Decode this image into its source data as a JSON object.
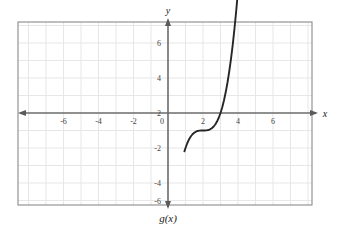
{
  "chart_data": {
    "type": "line",
    "title": "",
    "subtitle": "",
    "function_label": "g(x)",
    "function_expression": "(x - 2)^3 - 1",
    "xlabel": "x",
    "ylabel": "y",
    "xlim": [
      -8.2,
      8.3
    ],
    "ylim": [
      -7.6,
      7.6
    ],
    "grid": true,
    "grid_step": 1,
    "legend_position": "below-axes",
    "x_ticks": [
      -6,
      -4,
      -2,
      0,
      2,
      4,
      6
    ],
    "x_tick_labels": [
      "-6",
      "-4",
      "-2",
      "0",
      "2",
      "4",
      "6"
    ],
    "y_ticks": [
      -6,
      -4,
      -2,
      2,
      4,
      6
    ],
    "y_tick_labels": [
      "-6",
      "-4",
      "-2",
      "2",
      "4",
      "6"
    ],
    "origin_label": "0",
    "key_points": {
      "inflection": [
        2,
        -1
      ],
      "x_intercept": [
        3,
        0
      ],
      "y_at_x1": [
        1,
        -2
      ],
      "enters_top_at_x": 3.58,
      "enters_bottom_at_x": 0.95
    },
    "curve_points": [
      [
        0.94,
        -2.19
      ],
      [
        1.0,
        -2.0
      ],
      [
        1.1,
        -1.729
      ],
      [
        1.2,
        -1.512
      ],
      [
        1.3,
        -1.343
      ],
      [
        1.4,
        -1.216
      ],
      [
        1.5,
        -1.125
      ],
      [
        1.6,
        -1.064
      ],
      [
        1.7,
        -1.027
      ],
      [
        1.8,
        -1.008
      ],
      [
        1.9,
        -1.001
      ],
      [
        2.0,
        -1.0
      ],
      [
        2.1,
        -0.999
      ],
      [
        2.2,
        -0.992
      ],
      [
        2.3,
        -0.973
      ],
      [
        2.4,
        -0.936
      ],
      [
        2.5,
        -0.875
      ],
      [
        2.6,
        -0.784
      ],
      [
        2.7,
        -0.657
      ],
      [
        2.8,
        -0.488
      ],
      [
        2.9,
        -0.271
      ],
      [
        3.0,
        0.0
      ],
      [
        3.1,
        0.331
      ],
      [
        3.2,
        0.728
      ],
      [
        3.3,
        1.197
      ],
      [
        3.4,
        1.744
      ],
      [
        3.5,
        2.375
      ],
      [
        3.6,
        3.096
      ],
      [
        3.7,
        3.913
      ],
      [
        3.8,
        4.832
      ],
      [
        3.9,
        5.859
      ],
      [
        4.0,
        7.0
      ],
      [
        4.06,
        7.75
      ]
    ],
    "colors": {
      "curve": "#262626",
      "axis": "#6b6b6b",
      "grid": "#e7e7e7",
      "border": "#8a8a8a",
      "background": "#ffffff",
      "tick_text": "#444444"
    }
  }
}
